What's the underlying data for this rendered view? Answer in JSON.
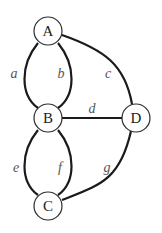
{
  "diagram": {
    "type": "graph",
    "nodes": [
      {
        "id": "A",
        "label": "A",
        "x": 48,
        "y": 31
      },
      {
        "id": "B",
        "label": "B",
        "x": 48,
        "y": 118
      },
      {
        "id": "C",
        "label": "C",
        "x": 48,
        "y": 206
      },
      {
        "id": "D",
        "label": "D",
        "x": 136,
        "y": 118
      }
    ],
    "edges": [
      {
        "id": "a",
        "label": "a",
        "from": "A",
        "to": "B"
      },
      {
        "id": "b",
        "label": "b",
        "from": "A",
        "to": "B"
      },
      {
        "id": "c",
        "label": "c",
        "from": "A",
        "to": "D"
      },
      {
        "id": "d",
        "label": "d",
        "from": "B",
        "to": "D"
      },
      {
        "id": "e",
        "label": "e",
        "from": "B",
        "to": "C"
      },
      {
        "id": "f",
        "label": "f",
        "from": "B",
        "to": "C"
      },
      {
        "id": "g",
        "label": "g",
        "from": "C",
        "to": "D"
      }
    ]
  }
}
